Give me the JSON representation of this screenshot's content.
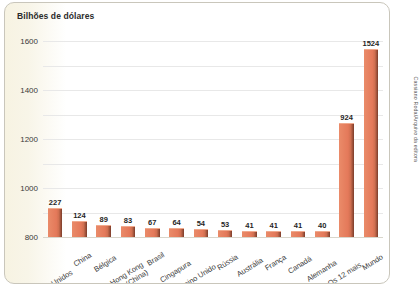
{
  "chart_data": {
    "type": "bar",
    "title": "Bilhões de dólares",
    "xlabel": "",
    "ylabel": "Bilhões de dólares",
    "ylim": [
      0,
      1600
    ],
    "yticks": [
      0,
      200,
      400,
      600,
      800,
      1000,
      1200,
      1400,
      1600
    ],
    "grid": true,
    "legend": false,
    "categories": [
      "Estados Unidos",
      "China",
      "Bélgica",
      "Hong Kong (China)",
      "Brasil",
      "Cingapura",
      "Reino Unido",
      "Rússia",
      "Austrália",
      "França",
      "Canadá",
      "Alemanha",
      "Os 12 mais",
      "Mundo"
    ],
    "values": [
      227,
      124,
      89,
      83,
      67,
      64,
      54,
      53,
      41,
      41,
      41,
      40,
      924,
      1524
    ],
    "bar_color": "#e4795a",
    "bar_top_color": "#f0a98d",
    "bar_side_color": "#7a3c2a"
  },
  "credit": "Cassiano Roda/Arquivo da editora"
}
